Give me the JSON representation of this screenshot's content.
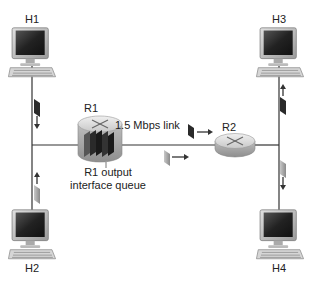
{
  "diagram": {
    "type": "network-topology",
    "hosts": [
      {
        "id": "H1",
        "label": "H1"
      },
      {
        "id": "H2",
        "label": "H2"
      },
      {
        "id": "H3",
        "label": "H3"
      },
      {
        "id": "H4",
        "label": "H4"
      }
    ],
    "routers": [
      {
        "id": "R1",
        "label": "R1"
      },
      {
        "id": "R2",
        "label": "R2"
      }
    ],
    "link_label": "1.5 Mbps link",
    "queue_label_line1": "R1 output",
    "queue_label_line2": "interface queue",
    "edges": [
      {
        "from": "H1",
        "to": "R1"
      },
      {
        "from": "H2",
        "to": "R1"
      },
      {
        "from": "R1",
        "to": "R2",
        "label": "1.5 Mbps link"
      },
      {
        "from": "R2",
        "to": "H3"
      },
      {
        "from": "R2",
        "to": "H4"
      }
    ],
    "colors": {
      "line": "#333333",
      "packet_dark": "#2a2a2a",
      "packet_light": "#9a9a9a",
      "router_body": "#c8c8c8"
    }
  }
}
